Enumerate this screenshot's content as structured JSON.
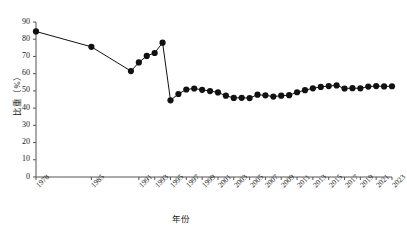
{
  "chart_data": {
    "type": "line",
    "title": "",
    "subtitle": "",
    "xlabel": "年份",
    "ylabel": "比重（%）",
    "ylim": [
      0,
      90
    ],
    "yticks": [
      0,
      10,
      20,
      30,
      40,
      50,
      60,
      70,
      80,
      90
    ],
    "xlim": [
      1978,
      2023
    ],
    "xticks": [
      1978,
      1985,
      1991,
      1993,
      1995,
      1997,
      1999,
      2001,
      2003,
      2005,
      2007,
      2009,
      2011,
      2013,
      2015,
      2017,
      2019,
      2021,
      2023
    ],
    "xtick_labels": [
      "1978",
      "1985",
      "1991",
      "1993",
      "1995",
      "1997",
      "1999",
      "2001",
      "2003",
      "2005",
      "2007",
      "2009",
      "2011",
      "2013",
      "2015",
      "2017",
      "2019",
      "2021",
      "2023"
    ],
    "grid": false,
    "legend": null,
    "marker": "circle",
    "marker_color": "#111111",
    "line_color": "#111111",
    "x": [
      1978,
      1985,
      1990,
      1991,
      1992,
      1993,
      1994,
      1995,
      1996,
      1997,
      1998,
      1999,
      2000,
      2001,
      2002,
      2003,
      2004,
      2005,
      2006,
      2007,
      2008,
      2009,
      2010,
      2011,
      2012,
      2013,
      2014,
      2015,
      2016,
      2017,
      2018,
      2019,
      2020,
      2021,
      2022,
      2023
    ],
    "values": [
      84.5,
      75.6,
      61.5,
      66.5,
      70.3,
      72.0,
      78.0,
      44.5,
      48.2,
      50.8,
      51.4,
      50.6,
      49.9,
      49.1,
      47.2,
      45.9,
      46.0,
      45.8,
      47.8,
      47.4,
      46.7,
      47.2,
      47.5,
      49.2,
      50.4,
      51.5,
      52.3,
      52.8,
      53.2,
      51.4,
      51.6,
      51.5,
      52.5,
      52.8,
      52.6,
      52.7
    ],
    "series_name": "比重"
  },
  "axes": {
    "y_axis_name": "y-axis",
    "x_axis_name": "x-axis"
  }
}
